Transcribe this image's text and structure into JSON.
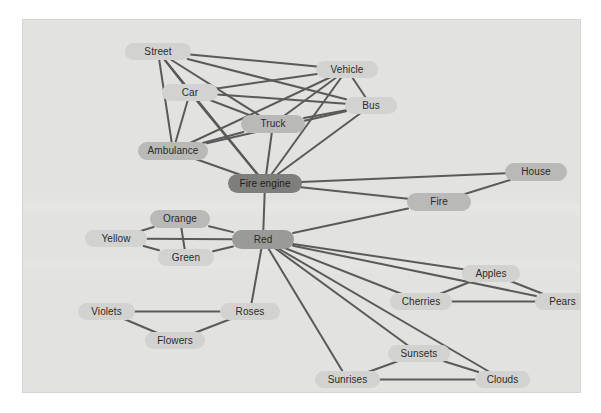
{
  "figure": {
    "kind": "semantic-network-graph",
    "background_color": "#e2e2e0",
    "page_color": "#ffffff",
    "edge_color": "#5a5a5a"
  },
  "chart_data": {
    "type": "diagram",
    "title": "",
    "subtitle": "",
    "xlabel": "",
    "ylabel": "",
    "layout": "force-directed node-link graph",
    "node_count": 22,
    "edge_count": 47,
    "nodes": [
      {
        "id": "street",
        "label": "Street",
        "x": 102,
        "y": 23,
        "w": 66,
        "h": 17,
        "shade": "lvl-light"
      },
      {
        "id": "vehicle",
        "label": "Vehicle",
        "x": 293,
        "y": 41,
        "w": 62,
        "h": 17,
        "shade": "lvl-light"
      },
      {
        "id": "car",
        "label": "Car",
        "x": 139,
        "y": 64,
        "w": 56,
        "h": 17,
        "shade": "lvl-light"
      },
      {
        "id": "bus",
        "label": "Bus",
        "x": 322,
        "y": 77,
        "w": 52,
        "h": 17,
        "shade": "lvl-light"
      },
      {
        "id": "truck",
        "label": "Truck",
        "x": 218,
        "y": 95,
        "w": 64,
        "h": 18,
        "shade": "lvl-mid"
      },
      {
        "id": "ambulance",
        "label": "Ambulance",
        "x": 115,
        "y": 122,
        "w": 70,
        "h": 18,
        "shade": "lvl-mid"
      },
      {
        "id": "fire-engine",
        "label": "Fire engine",
        "x": 205,
        "y": 154,
        "w": 74,
        "h": 19,
        "shade": "lvl-darkest"
      },
      {
        "id": "house",
        "label": "House",
        "x": 482,
        "y": 143,
        "w": 62,
        "h": 18,
        "shade": "lvl-mid"
      },
      {
        "id": "fire",
        "label": "Fire",
        "x": 384,
        "y": 173,
        "w": 64,
        "h": 18,
        "shade": "lvl-mid"
      },
      {
        "id": "orange",
        "label": "Orange",
        "x": 127,
        "y": 190,
        "w": 60,
        "h": 18,
        "shade": "lvl-mid"
      },
      {
        "id": "red",
        "label": "Red",
        "x": 209,
        "y": 210,
        "w": 62,
        "h": 19,
        "shade": "lvl-dark"
      },
      {
        "id": "yellow",
        "label": "Yellow",
        "x": 62,
        "y": 210,
        "w": 62,
        "h": 17,
        "shade": "lvl-light"
      },
      {
        "id": "green",
        "label": "Green",
        "x": 135,
        "y": 229,
        "w": 56,
        "h": 17,
        "shade": "lvl-light"
      },
      {
        "id": "apples",
        "label": "Apples",
        "x": 439,
        "y": 245,
        "w": 58,
        "h": 17,
        "shade": "lvl-light"
      },
      {
        "id": "cherries",
        "label": "Cherries",
        "x": 367,
        "y": 273,
        "w": 62,
        "h": 17,
        "shade": "lvl-light"
      },
      {
        "id": "pears",
        "label": "Pears",
        "x": 512,
        "y": 273,
        "w": 55,
        "h": 17,
        "shade": "lvl-light"
      },
      {
        "id": "violets",
        "label": "Violets",
        "x": 55,
        "y": 283,
        "w": 57,
        "h": 17,
        "shade": "lvl-light"
      },
      {
        "id": "roses",
        "label": "Roses",
        "x": 197,
        "y": 283,
        "w": 60,
        "h": 17,
        "shade": "lvl-light"
      },
      {
        "id": "flowers",
        "label": "Flowers",
        "x": 122,
        "y": 312,
        "w": 60,
        "h": 17,
        "shade": "lvl-light"
      },
      {
        "id": "sunsets",
        "label": "Sunsets",
        "x": 365,
        "y": 325,
        "w": 62,
        "h": 17,
        "shade": "lvl-light"
      },
      {
        "id": "sunrises",
        "label": "Sunrises",
        "x": 292,
        "y": 351,
        "w": 65,
        "h": 17,
        "shade": "lvl-light"
      },
      {
        "id": "clouds",
        "label": "Clouds",
        "x": 452,
        "y": 351,
        "w": 55,
        "h": 17,
        "shade": "lvl-light"
      }
    ],
    "edges": [
      {
        "from": "street",
        "to": "car"
      },
      {
        "from": "street",
        "to": "ambulance"
      },
      {
        "from": "street",
        "to": "truck"
      },
      {
        "from": "street",
        "to": "bus"
      },
      {
        "from": "street",
        "to": "vehicle"
      },
      {
        "from": "street",
        "to": "fire-engine"
      },
      {
        "from": "car",
        "to": "vehicle"
      },
      {
        "from": "car",
        "to": "ambulance"
      },
      {
        "from": "car",
        "to": "truck"
      },
      {
        "from": "car",
        "to": "bus"
      },
      {
        "from": "car",
        "to": "fire-engine"
      },
      {
        "from": "vehicle",
        "to": "bus"
      },
      {
        "from": "vehicle",
        "to": "truck"
      },
      {
        "from": "vehicle",
        "to": "ambulance"
      },
      {
        "from": "vehicle",
        "to": "fire-engine"
      },
      {
        "from": "bus",
        "to": "truck"
      },
      {
        "from": "bus",
        "to": "ambulance"
      },
      {
        "from": "bus",
        "to": "fire-engine"
      },
      {
        "from": "truck",
        "to": "ambulance"
      },
      {
        "from": "truck",
        "to": "fire-engine"
      },
      {
        "from": "ambulance",
        "to": "fire-engine"
      },
      {
        "from": "fire-engine",
        "to": "house"
      },
      {
        "from": "fire-engine",
        "to": "fire"
      },
      {
        "from": "fire-engine",
        "to": "red"
      },
      {
        "from": "fire",
        "to": "house"
      },
      {
        "from": "fire",
        "to": "red"
      },
      {
        "from": "red",
        "to": "orange"
      },
      {
        "from": "red",
        "to": "yellow"
      },
      {
        "from": "red",
        "to": "green"
      },
      {
        "from": "orange",
        "to": "yellow"
      },
      {
        "from": "orange",
        "to": "green"
      },
      {
        "from": "yellow",
        "to": "green"
      },
      {
        "from": "red",
        "to": "apples"
      },
      {
        "from": "red",
        "to": "cherries"
      },
      {
        "from": "red",
        "to": "pears"
      },
      {
        "from": "apples",
        "to": "cherries"
      },
      {
        "from": "apples",
        "to": "pears"
      },
      {
        "from": "cherries",
        "to": "pears"
      },
      {
        "from": "red",
        "to": "roses"
      },
      {
        "from": "roses",
        "to": "violets"
      },
      {
        "from": "roses",
        "to": "flowers"
      },
      {
        "from": "violets",
        "to": "flowers"
      },
      {
        "from": "red",
        "to": "sunsets"
      },
      {
        "from": "red",
        "to": "sunrises"
      },
      {
        "from": "red",
        "to": "clouds"
      },
      {
        "from": "sunsets",
        "to": "sunrises"
      },
      {
        "from": "sunsets",
        "to": "clouds"
      },
      {
        "from": "sunrises",
        "to": "clouds"
      }
    ]
  }
}
